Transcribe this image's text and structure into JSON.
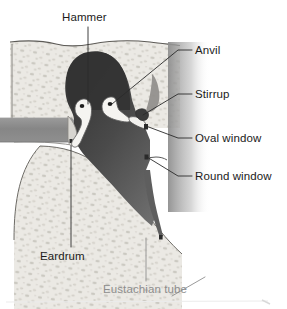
{
  "figure": {
    "type": "anatomical-diagram",
    "background_color": "#ffffff"
  },
  "colors": {
    "bone": "#e9e7e2",
    "bone_speckle": "#b9b6ae",
    "bone_outline": "#6e6c67",
    "cavity_dark": "#3a3a3a",
    "cavity_mid": "#6f6f6f",
    "canal": "#8b8b8b",
    "ossicle": "#f4f3f0",
    "ossicle_outline": "#5f5f5f",
    "label_text": "#1b1b1b",
    "label_text_muted": "#8d8d8d",
    "leader_line": "#2a2a2a",
    "leader_line_muted": "#9a9a9a"
  },
  "labels": [
    {
      "id": "hammer",
      "text": "Hammer",
      "color": "#1b1b1b",
      "leader": "vertical-down"
    },
    {
      "id": "anvil",
      "text": "Anvil",
      "color": "#1b1b1b",
      "leader": "diagonal-left-down"
    },
    {
      "id": "stirrup",
      "text": "Stirrup",
      "color": "#1b1b1b",
      "leader": "diagonal-left-down"
    },
    {
      "id": "oval-window",
      "text": "Oval window",
      "color": "#1b1b1b",
      "leader": "diagonal-left-up"
    },
    {
      "id": "round-window",
      "text": "Round window",
      "color": "#1b1b1b",
      "leader": "diagonal-left-up"
    },
    {
      "id": "eardrum",
      "text": "Eardrum",
      "color": "#1b1b1b",
      "leader": "vertical-up"
    },
    {
      "id": "eustachian-tube",
      "text": "Eustachian tube",
      "color": "#8d8d8d",
      "leader": "vertical-up"
    }
  ],
  "structures": [
    {
      "id": "temporal-bone",
      "name": "Temporal bone (speckled)"
    },
    {
      "id": "tympanic-cavity",
      "name": "Tympanic cavity"
    },
    {
      "id": "ear-canal",
      "name": "External auditory canal"
    },
    {
      "id": "malleus",
      "name": "Malleus (hammer)"
    },
    {
      "id": "incus",
      "name": "Incus (anvil)"
    },
    {
      "id": "stapes",
      "name": "Stapes (stirrup)"
    },
    {
      "id": "tympanic-membrane",
      "name": "Tympanic membrane (eardrum)"
    },
    {
      "id": "eustachian-tube",
      "name": "Eustachian tube"
    }
  ]
}
